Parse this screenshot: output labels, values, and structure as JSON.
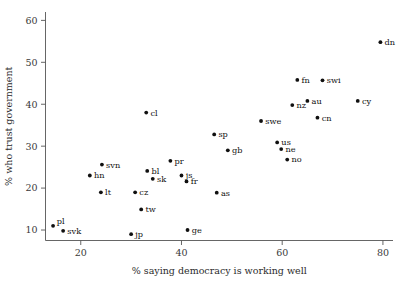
{
  "chart_data": {
    "type": "scatter",
    "title": "",
    "xlabel": "% saying democracy is working well",
    "ylabel": "% who trust government",
    "xlim": [
      13,
      82
    ],
    "ylim": [
      7.5,
      62
    ],
    "xticks": [
      20,
      40,
      60,
      80
    ],
    "yticks": [
      10,
      20,
      30,
      40,
      50,
      60
    ],
    "grid": false,
    "legend": null,
    "marker": "filled-circle",
    "marker_color": "#101010",
    "points": [
      {
        "label": "pl",
        "x": 14.5,
        "y": 11.0,
        "label_pos": "upper-right"
      },
      {
        "label": "svk",
        "x": 16.5,
        "y": 9.8,
        "label_pos": "right"
      },
      {
        "label": "hn",
        "x": 21.8,
        "y": 23.0,
        "label_pos": "right"
      },
      {
        "label": "svn",
        "x": 24.2,
        "y": 25.6,
        "label_pos": "right"
      },
      {
        "label": "lt",
        "x": 24.0,
        "y": 19.0,
        "label_pos": "right"
      },
      {
        "label": "jp",
        "x": 30.0,
        "y": 9.0,
        "label_pos": "right"
      },
      {
        "label": "cz",
        "x": 30.8,
        "y": 19.0,
        "label_pos": "right"
      },
      {
        "label": "tw",
        "x": 32.0,
        "y": 14.9,
        "label_pos": "right"
      },
      {
        "label": "cl",
        "x": 33.0,
        "y": 38.0,
        "label_pos": "right"
      },
      {
        "label": "bl",
        "x": 33.2,
        "y": 24.1,
        "label_pos": "right"
      },
      {
        "label": "sk",
        "x": 34.3,
        "y": 22.2,
        "label_pos": "right"
      },
      {
        "label": "pr",
        "x": 37.8,
        "y": 26.5,
        "label_pos": "right"
      },
      {
        "label": "js",
        "x": 40.0,
        "y": 23.0,
        "label_pos": "right"
      },
      {
        "label": "fr",
        "x": 41.0,
        "y": 21.6,
        "label_pos": "right"
      },
      {
        "label": "ge",
        "x": 41.2,
        "y": 10.0,
        "label_pos": "right"
      },
      {
        "label": "sp",
        "x": 46.5,
        "y": 32.8,
        "label_pos": "right"
      },
      {
        "label": "as",
        "x": 47.0,
        "y": 18.9,
        "label_pos": "right"
      },
      {
        "label": "gb",
        "x": 49.2,
        "y": 29.0,
        "label_pos": "right"
      },
      {
        "label": "swe",
        "x": 55.8,
        "y": 36.0,
        "label_pos": "right"
      },
      {
        "label": "us",
        "x": 59.0,
        "y": 30.9,
        "label_pos": "right"
      },
      {
        "label": "ne",
        "x": 59.8,
        "y": 29.3,
        "label_pos": "right"
      },
      {
        "label": "no",
        "x": 61.0,
        "y": 26.8,
        "label_pos": "right"
      },
      {
        "label": "nz",
        "x": 62.0,
        "y": 39.8,
        "label_pos": "right"
      },
      {
        "label": "fn",
        "x": 63.0,
        "y": 45.8,
        "label_pos": "right"
      },
      {
        "label": "au",
        "x": 65.0,
        "y": 40.8,
        "label_pos": "right"
      },
      {
        "label": "cn",
        "x": 67.0,
        "y": 36.8,
        "label_pos": "right"
      },
      {
        "label": "swi",
        "x": 68.0,
        "y": 45.7,
        "label_pos": "right"
      },
      {
        "label": "cy",
        "x": 75.0,
        "y": 40.8,
        "label_pos": "right"
      },
      {
        "label": "dn",
        "x": 79.5,
        "y": 54.8,
        "label_pos": "right"
      }
    ]
  }
}
